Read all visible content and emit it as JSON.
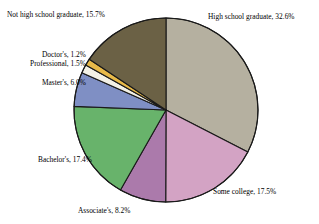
{
  "chart_data": {
    "type": "pie",
    "title": "",
    "subtitle": "",
    "xlabel": "",
    "ylabel": "",
    "legend_position": "none",
    "grid": false,
    "labels_outside": true,
    "start_angle_deg": 0,
    "direction": "clockwise",
    "total_percent": 100.1,
    "categories": [
      "High school graduate",
      "Some college",
      "Associate's",
      "Bachelor's",
      "Master's",
      "Professional",
      "Doctor's",
      "Not high school graduate"
    ],
    "values": [
      32.6,
      17.5,
      8.2,
      17.4,
      6.0,
      1.5,
      1.2,
      15.7
    ],
    "colors": [
      "#b5b0a0",
      "#d3a3c4",
      "#ab7aab",
      "#68b36b",
      "#7f8fc4",
      "#f3f1e6",
      "#e7b949",
      "#6b6145"
    ],
    "slices": [
      {
        "label": "High school graduate",
        "value": 32.6,
        "value_text": "32.6%",
        "color": "#b5b0a0",
        "caption": "High school graduate, 32.6%"
      },
      {
        "label": "Some college",
        "value": 17.5,
        "value_text": "17.5%",
        "color": "#d3a3c4",
        "caption": "Some college, 17.5%"
      },
      {
        "label": "Associate's",
        "value": 8.2,
        "value_text": "8.2%",
        "color": "#ab7aab",
        "caption": "Associate's, 8.2%"
      },
      {
        "label": "Bachelor's",
        "value": 17.4,
        "value_text": "17.4%",
        "color": "#68b36b",
        "caption": "Bachelor's, 17.4%"
      },
      {
        "label": "Master's",
        "value": 6.0,
        "value_text": "6.0%",
        "color": "#7f8fc4",
        "caption": "Master's, 6.0%"
      },
      {
        "label": "Professional",
        "value": 1.5,
        "value_text": "1.5%",
        "color": "#f3f1e6",
        "caption": "Professional, 1.5%"
      },
      {
        "label": "Doctor's",
        "value": 1.2,
        "value_text": "1.2%",
        "color": "#e7b949",
        "caption": "Doctor's, 1.2%"
      },
      {
        "label": "Not high school graduate",
        "value": 15.7,
        "value_text": "15.7%",
        "color": "#6b6145",
        "caption": "Not high school graduate, 15.7%"
      }
    ]
  },
  "geometry": {
    "center_x": 166,
    "center_y": 110,
    "radius": 92,
    "stroke_color": "#1a1a1a",
    "stroke_width": 1.1
  },
  "background_color": "#ffffff"
}
